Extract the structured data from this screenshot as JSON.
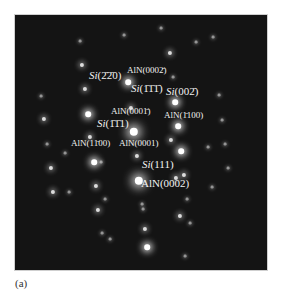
{
  "figure": {
    "caption": "(a)",
    "panel_background": "#141414",
    "labels": [
      {
        "id": "si-m2m20",
        "text": "Si(2̄2̄0)",
        "x": 89,
        "y": 75,
        "size": 11,
        "italic_prefix": "Si"
      },
      {
        "id": "aln-000m2",
        "text": "AlN(0002̄)",
        "x": 127,
        "y": 70,
        "size": 9
      },
      {
        "id": "si-m1m1m1",
        "text": "Si(1̄1̄1̄)",
        "x": 131,
        "y": 88,
        "size": 11,
        "italic_prefix": "Si"
      },
      {
        "id": "si-00m2",
        "text": "Si(002̄)",
        "x": 166,
        "y": 91,
        "size": 11,
        "italic_prefix": "Si"
      },
      {
        "id": "aln-000m1",
        "text": "AlN(0001̄)",
        "x": 111,
        "y": 111,
        "size": 9
      },
      {
        "id": "aln-m1100",
        "text": "AlN(1̄100)",
        "x": 164,
        "y": 115,
        "size": 9
      },
      {
        "id": "si-m1m11",
        "text": "Si(1̄1̄1)",
        "x": 97,
        "y": 123,
        "size": 11,
        "italic_prefix": "Si"
      },
      {
        "id": "aln-1m100",
        "text": "AlN(11̄00)",
        "x": 71,
        "y": 143,
        "size": 9
      },
      {
        "id": "aln-0001",
        "text": "AlN(0001)",
        "x": 119,
        "y": 143,
        "size": 9
      },
      {
        "id": "si-111",
        "text": "Si(111)",
        "x": 142,
        "y": 164,
        "size": 11,
        "italic_prefix": "Si"
      },
      {
        "id": "aln-0002",
        "text": "AlN(0002)",
        "x": 141,
        "y": 183,
        "size": 11
      }
    ],
    "spots": [
      [
        128,
        82,
        4
      ],
      [
        175,
        102,
        4
      ],
      [
        88,
        114,
        4
      ],
      [
        131,
        108,
        3
      ],
      [
        134,
        132,
        6
      ],
      [
        178,
        126,
        4
      ],
      [
        90,
        137,
        3
      ],
      [
        171,
        140,
        3
      ],
      [
        181,
        151,
        4
      ],
      [
        137,
        156,
        3
      ],
      [
        94,
        162,
        4
      ],
      [
        101,
        162,
        2
      ],
      [
        139,
        181,
        6
      ],
      [
        176,
        178,
        3
      ],
      [
        184,
        175,
        3
      ],
      [
        96,
        186,
        3
      ],
      [
        105,
        199,
        2
      ],
      [
        98,
        210,
        3
      ],
      [
        142,
        204,
        2
      ],
      [
        143,
        209,
        2
      ],
      [
        180,
        216,
        3
      ],
      [
        145,
        229,
        3
      ],
      [
        110,
        239,
        2
      ],
      [
        147,
        247,
        4
      ],
      [
        82,
        65,
        3
      ],
      [
        85,
        89,
        3
      ],
      [
        44,
        119,
        3
      ],
      [
        47,
        144,
        2
      ],
      [
        65,
        153,
        2
      ],
      [
        51,
        168,
        3
      ],
      [
        53,
        192,
        3
      ],
      [
        69,
        192,
        2
      ],
      [
        170,
        53,
        3
      ],
      [
        173,
        77,
        2
      ],
      [
        219,
        95,
        2
      ],
      [
        222,
        120,
        2
      ],
      [
        208,
        147,
        2
      ],
      [
        225,
        144,
        2
      ],
      [
        228,
        168,
        2
      ],
      [
        212,
        187,
        2
      ],
      [
        187,
        199,
        2
      ],
      [
        190,
        223,
        2
      ],
      [
        102,
        233,
        2
      ],
      [
        185,
        256,
        2
      ],
      [
        80,
        41,
        2
      ],
      [
        124,
        35,
        2
      ],
      [
        41,
        96,
        2
      ],
      [
        213,
        37,
        2
      ],
      [
        161,
        28,
        2
      ],
      [
        196,
        42,
        2
      ]
    ]
  }
}
